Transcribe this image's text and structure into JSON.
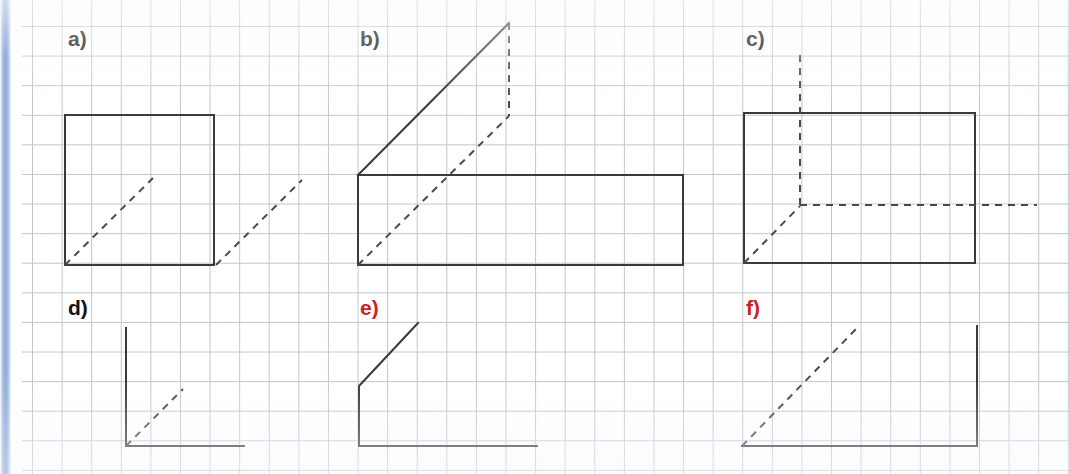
{
  "page": {
    "width": 1069,
    "height": 474,
    "background_color": "#ffffff",
    "grid": {
      "visible": true,
      "cell_size_px": 29.6,
      "line_color": "#b6bcc6"
    },
    "spine": {
      "color": "#8ba9d8",
      "position": "left"
    }
  },
  "style": {
    "stroke_color": "#3a3a3a",
    "stroke_width": 2,
    "dash_color": "#4a4a4a",
    "dash_pattern": "7 6",
    "label_black": "#121212",
    "label_red": "#cc2222"
  },
  "figures": [
    {
      "id": "a",
      "label": "a)",
      "label_color": "#121212",
      "label_x": 68,
      "label_y": 28,
      "description": "square with interior dashed half-diagonal and a second dashed segment outside the lower-right corner",
      "solid_paths": [
        "M 65 115 L 214 115 L 214 265 L 65 265 Z"
      ],
      "dashed_paths": [
        "M 65 265 L 153 178",
        "M 216 265 L 302 180"
      ]
    },
    {
      "id": "b",
      "label": "b)",
      "label_color": "#121212",
      "label_x": 360,
      "label_y": 28,
      "description": "long rectangle with a solid diagonal rising from its top-left to an apex, a dashed vertical dropping from the apex, and a dashed diagonal from the bottom-left corner",
      "solid_paths": [
        "M 358 175 L 683 175 L 683 265 L 358 265 Z",
        "M 358 175 L 509 23"
      ],
      "dashed_paths": [
        "M 509 23 L 509 116",
        "M 358 265 L 509 116"
      ]
    },
    {
      "id": "c",
      "label": "c)",
      "label_color": "#121212",
      "label_x": 746,
      "label_y": 28,
      "description": "rectangle with a dashed vertical crossing its top edge, a dashed horizontal exiting past its right edge, and a short dashed diagonal from the bottom-left corner",
      "solid_paths": [
        "M 744 113 L 975 113 L 975 263 L 744 263 Z"
      ],
      "dashed_paths": [
        "M 800 55 L 800 205",
        "M 800 205 L 1037 205",
        "M 744 263 L 800 206"
      ]
    },
    {
      "id": "d",
      "label": "d)",
      "label_color": "#121212",
      "label_x": 68,
      "label_y": 297,
      "description": "open L shape: vertical line meeting a horizontal line, with a short dashed diagonal from the corner",
      "solid_paths": [
        "M 126 328 L 126 446 L 244 446"
      ],
      "dashed_paths": [
        "M 126 446 L 183 389"
      ]
    },
    {
      "id": "e",
      "label": "e)",
      "label_color": "#cc2222",
      "label_x": 360,
      "label_y": 297,
      "description": "solid polyline: short diagonal up-right, down the vertical, then a long horizontal to the right",
      "solid_paths": [
        "M 418 323 L 359 386 L 359 446 L 537 446"
      ],
      "dashed_paths": []
    },
    {
      "id": "f",
      "label": "f)",
      "label_color": "#cc2222",
      "label_x": 746,
      "label_y": 297,
      "description": "solid L shape opening left, with a long dashed diagonal rising from the bottom-left corner",
      "solid_paths": [
        "M 742 446 L 977 446 L 977 326"
      ],
      "dashed_paths": [
        "M 742 446 L 858 327"
      ]
    }
  ]
}
